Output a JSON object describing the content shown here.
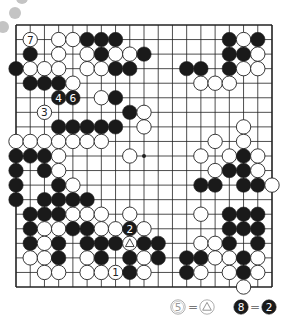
{
  "diagram": {
    "type": "go-board",
    "size": 19,
    "colors": {
      "background": "#ffffff",
      "line": "#222222",
      "black_stone": "#1a1a1a",
      "white_stone": "#ffffff",
      "stone_edge": "#222222",
      "decor_circle": "#bdbdbd",
      "legend_text": "#777777"
    },
    "star_points": [
      [
        3,
        9
      ],
      [
        9,
        9
      ],
      [
        16,
        9
      ]
    ],
    "stones": [
      {
        "c": "W",
        "x": 1,
        "y": 1,
        "label": "7"
      },
      {
        "c": "W",
        "x": 3,
        "y": 1
      },
      {
        "c": "W",
        "x": 4,
        "y": 1
      },
      {
        "c": "B",
        "x": 5,
        "y": 1
      },
      {
        "c": "B",
        "x": 6,
        "y": 1
      },
      {
        "c": "B",
        "x": 7,
        "y": 1
      },
      {
        "c": "B",
        "x": 15,
        "y": 1
      },
      {
        "c": "W",
        "x": 16,
        "y": 1
      },
      {
        "c": "B",
        "x": 17,
        "y": 1
      },
      {
        "c": "B",
        "x": 1,
        "y": 2
      },
      {
        "c": "W",
        "x": 3,
        "y": 2
      },
      {
        "c": "W",
        "x": 5,
        "y": 2
      },
      {
        "c": "B",
        "x": 6,
        "y": 2
      },
      {
        "c": "W",
        "x": 7,
        "y": 2
      },
      {
        "c": "W",
        "x": 8,
        "y": 2
      },
      {
        "c": "B",
        "x": 9,
        "y": 2
      },
      {
        "c": "B",
        "x": 15,
        "y": 2
      },
      {
        "c": "B",
        "x": 16,
        "y": 2
      },
      {
        "c": "W",
        "x": 17,
        "y": 2
      },
      {
        "c": "B",
        "x": 0,
        "y": 3
      },
      {
        "c": "W",
        "x": 1,
        "y": 3
      },
      {
        "c": "W",
        "x": 2,
        "y": 3
      },
      {
        "c": "W",
        "x": 3,
        "y": 3
      },
      {
        "c": "W",
        "x": 5,
        "y": 3
      },
      {
        "c": "W",
        "x": 6,
        "y": 3
      },
      {
        "c": "B",
        "x": 7,
        "y": 3
      },
      {
        "c": "B",
        "x": 8,
        "y": 3
      },
      {
        "c": "B",
        "x": 12,
        "y": 3
      },
      {
        "c": "B",
        "x": 13,
        "y": 3
      },
      {
        "c": "B",
        "x": 15,
        "y": 3
      },
      {
        "c": "W",
        "x": 16,
        "y": 3
      },
      {
        "c": "W",
        "x": 17,
        "y": 3
      },
      {
        "c": "B",
        "x": 1,
        "y": 4
      },
      {
        "c": "B",
        "x": 2,
        "y": 4
      },
      {
        "c": "B",
        "x": 3,
        "y": 4
      },
      {
        "c": "W",
        "x": 4,
        "y": 4
      },
      {
        "c": "W",
        "x": 13,
        "y": 4
      },
      {
        "c": "W",
        "x": 14,
        "y": 4
      },
      {
        "c": "W",
        "x": 15,
        "y": 4
      },
      {
        "c": "B",
        "x": 3,
        "y": 5,
        "label": "4"
      },
      {
        "c": "B",
        "x": 4,
        "y": 5,
        "label": "6"
      },
      {
        "c": "W",
        "x": 6,
        "y": 5
      },
      {
        "c": "B",
        "x": 7,
        "y": 5
      },
      {
        "c": "W",
        "x": 2,
        "y": 6,
        "label": "3"
      },
      {
        "c": "B",
        "x": 8,
        "y": 6
      },
      {
        "c": "W",
        "x": 9,
        "y": 6
      },
      {
        "c": "B",
        "x": 3,
        "y": 7
      },
      {
        "c": "B",
        "x": 4,
        "y": 7
      },
      {
        "c": "B",
        "x": 5,
        "y": 7
      },
      {
        "c": "B",
        "x": 6,
        "y": 7
      },
      {
        "c": "B",
        "x": 7,
        "y": 7
      },
      {
        "c": "W",
        "x": 9,
        "y": 7
      },
      {
        "c": "W",
        "x": 16,
        "y": 7
      },
      {
        "c": "W",
        "x": 0,
        "y": 8
      },
      {
        "c": "W",
        "x": 1,
        "y": 8
      },
      {
        "c": "W",
        "x": 2,
        "y": 8
      },
      {
        "c": "W",
        "x": 3,
        "y": 8
      },
      {
        "c": "W",
        "x": 4,
        "y": 8
      },
      {
        "c": "W",
        "x": 5,
        "y": 8
      },
      {
        "c": "W",
        "x": 6,
        "y": 8
      },
      {
        "c": "W",
        "x": 14,
        "y": 8
      },
      {
        "c": "W",
        "x": 16,
        "y": 8
      },
      {
        "c": "B",
        "x": 0,
        "y": 9
      },
      {
        "c": "B",
        "x": 1,
        "y": 9
      },
      {
        "c": "B",
        "x": 2,
        "y": 9
      },
      {
        "c": "W",
        "x": 3,
        "y": 9
      },
      {
        "c": "W",
        "x": 8,
        "y": 9
      },
      {
        "c": "W",
        "x": 13,
        "y": 9
      },
      {
        "c": "W",
        "x": 15,
        "y": 9
      },
      {
        "c": "B",
        "x": 16,
        "y": 9
      },
      {
        "c": "W",
        "x": 17,
        "y": 9
      },
      {
        "c": "B",
        "x": 0,
        "y": 10
      },
      {
        "c": "B",
        "x": 2,
        "y": 10
      },
      {
        "c": "W",
        "x": 3,
        "y": 10
      },
      {
        "c": "W",
        "x": 14,
        "y": 10
      },
      {
        "c": "B",
        "x": 15,
        "y": 10
      },
      {
        "c": "B",
        "x": 16,
        "y": 10
      },
      {
        "c": "W",
        "x": 17,
        "y": 10
      },
      {
        "c": "B",
        "x": 0,
        "y": 11
      },
      {
        "c": "B",
        "x": 3,
        "y": 11
      },
      {
        "c": "W",
        "x": 4,
        "y": 11
      },
      {
        "c": "B",
        "x": 13,
        "y": 11
      },
      {
        "c": "B",
        "x": 14,
        "y": 11
      },
      {
        "c": "B",
        "x": 16,
        "y": 11
      },
      {
        "c": "B",
        "x": 17,
        "y": 11
      },
      {
        "c": "W",
        "x": 18,
        "y": 11
      },
      {
        "c": "B",
        "x": 0,
        "y": 12
      },
      {
        "c": "B",
        "x": 2,
        "y": 12
      },
      {
        "c": "B",
        "x": 3,
        "y": 12
      },
      {
        "c": "B",
        "x": 4,
        "y": 12
      },
      {
        "c": "B",
        "x": 5,
        "y": 12
      },
      {
        "c": "B",
        "x": 1,
        "y": 13
      },
      {
        "c": "B",
        "x": 2,
        "y": 13
      },
      {
        "c": "B",
        "x": 3,
        "y": 13
      },
      {
        "c": "W",
        "x": 4,
        "y": 13
      },
      {
        "c": "W",
        "x": 5,
        "y": 13
      },
      {
        "c": "W",
        "x": 6,
        "y": 13
      },
      {
        "c": "W",
        "x": 8,
        "y": 13
      },
      {
        "c": "W",
        "x": 13,
        "y": 13
      },
      {
        "c": "B",
        "x": 15,
        "y": 13
      },
      {
        "c": "B",
        "x": 16,
        "y": 13
      },
      {
        "c": "B",
        "x": 17,
        "y": 13
      },
      {
        "c": "B",
        "x": 1,
        "y": 14
      },
      {
        "c": "W",
        "x": 2,
        "y": 14
      },
      {
        "c": "W",
        "x": 3,
        "y": 14
      },
      {
        "c": "B",
        "x": 4,
        "y": 14
      },
      {
        "c": "B",
        "x": 5,
        "y": 14
      },
      {
        "c": "W",
        "x": 6,
        "y": 14
      },
      {
        "c": "W",
        "x": 7,
        "y": 14
      },
      {
        "c": "B",
        "x": 8,
        "y": 14,
        "label": "2"
      },
      {
        "c": "W",
        "x": 9,
        "y": 14
      },
      {
        "c": "B",
        "x": 15,
        "y": 14
      },
      {
        "c": "B",
        "x": 16,
        "y": 14
      },
      {
        "c": "B",
        "x": 17,
        "y": 14
      },
      {
        "c": "B",
        "x": 1,
        "y": 15
      },
      {
        "c": "W",
        "x": 2,
        "y": 15
      },
      {
        "c": "B",
        "x": 3,
        "y": 15
      },
      {
        "c": "B",
        "x": 5,
        "y": 15
      },
      {
        "c": "B",
        "x": 6,
        "y": 15
      },
      {
        "c": "B",
        "x": 7,
        "y": 15
      },
      {
        "c": "W",
        "x": 8,
        "y": 15,
        "mark": "triangle"
      },
      {
        "c": "B",
        "x": 9,
        "y": 15
      },
      {
        "c": "B",
        "x": 10,
        "y": 15
      },
      {
        "c": "W",
        "x": 13,
        "y": 15
      },
      {
        "c": "W",
        "x": 14,
        "y": 15
      },
      {
        "c": "B",
        "x": 15,
        "y": 15
      },
      {
        "c": "B",
        "x": 17,
        "y": 15
      },
      {
        "c": "W",
        "x": 1,
        "y": 16
      },
      {
        "c": "W",
        "x": 2,
        "y": 16
      },
      {
        "c": "B",
        "x": 3,
        "y": 16
      },
      {
        "c": "W",
        "x": 5,
        "y": 16
      },
      {
        "c": "B",
        "x": 6,
        "y": 16
      },
      {
        "c": "B",
        "x": 8,
        "y": 16
      },
      {
        "c": "W",
        "x": 9,
        "y": 16
      },
      {
        "c": "B",
        "x": 10,
        "y": 16
      },
      {
        "c": "B",
        "x": 12,
        "y": 16
      },
      {
        "c": "B",
        "x": 13,
        "y": 16
      },
      {
        "c": "W",
        "x": 14,
        "y": 16
      },
      {
        "c": "W",
        "x": 15,
        "y": 16
      },
      {
        "c": "B",
        "x": 16,
        "y": 16
      },
      {
        "c": "W",
        "x": 17,
        "y": 16
      },
      {
        "c": "W",
        "x": 2,
        "y": 17
      },
      {
        "c": "W",
        "x": 3,
        "y": 17
      },
      {
        "c": "W",
        "x": 5,
        "y": 17
      },
      {
        "c": "W",
        "x": 6,
        "y": 17
      },
      {
        "c": "W",
        "x": 7,
        "y": 17,
        "label": "1"
      },
      {
        "c": "B",
        "x": 8,
        "y": 17
      },
      {
        "c": "W",
        "x": 9,
        "y": 17
      },
      {
        "c": "B",
        "x": 12,
        "y": 17
      },
      {
        "c": "W",
        "x": 13,
        "y": 17
      },
      {
        "c": "W",
        "x": 15,
        "y": 17
      },
      {
        "c": "B",
        "x": 16,
        "y": 17
      },
      {
        "c": "W",
        "x": 17,
        "y": 17
      },
      {
        "c": "W",
        "x": 16,
        "y": 18
      }
    ]
  },
  "legend": [
    {
      "left_stone": {
        "c": "W",
        "label": "5",
        "style": "double"
      },
      "equals": "=",
      "right_stone": {
        "c": "W",
        "mark": "triangle"
      }
    },
    {
      "left_stone": {
        "c": "B",
        "label": "8"
      },
      "equals": "=",
      "right_stone": {
        "c": "B",
        "label": "2"
      }
    }
  ]
}
